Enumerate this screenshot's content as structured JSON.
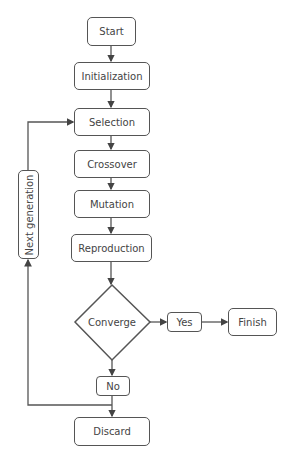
{
  "diagram": {
    "type": "flowchart",
    "nodes": {
      "start": "Start",
      "initialization": "Initialization",
      "selection": "Selection",
      "crossover": "Crossover",
      "mutation": "Mutation",
      "reproduction": "Reproduction",
      "converge": "Converge",
      "yes": "Yes",
      "finish": "Finish",
      "no": "No",
      "discard": "Discard",
      "next_generation": "Next generation"
    },
    "edges": [
      [
        "Start",
        "Initialization"
      ],
      [
        "Initialization",
        "Selection"
      ],
      [
        "Selection",
        "Crossover"
      ],
      [
        "Crossover",
        "Mutation"
      ],
      [
        "Mutation",
        "Reproduction"
      ],
      [
        "Reproduction",
        "Converge"
      ],
      [
        "Converge",
        "Yes"
      ],
      [
        "Yes",
        "Finish"
      ],
      [
        "Converge",
        "No"
      ],
      [
        "No",
        "Discard"
      ],
      [
        "No",
        "Next generation"
      ],
      [
        "Next generation",
        "Selection"
      ]
    ],
    "colors": {
      "stroke": "#555555",
      "text": "#444444",
      "background": "#ffffff"
    }
  }
}
